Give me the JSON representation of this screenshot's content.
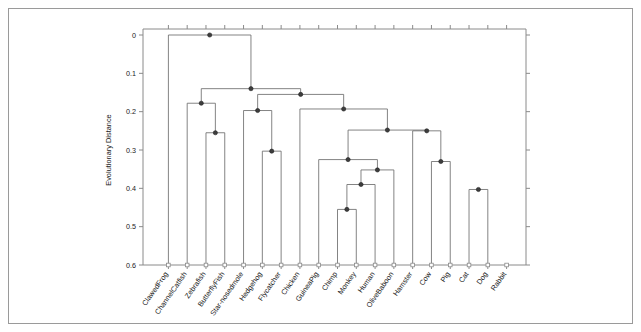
{
  "figure": {
    "background_color": "#ffffff",
    "frame_color": "#9a9a9a",
    "link_color": "#6e6e6e",
    "node_color": "#3d3d3d"
  },
  "chart_data": {
    "type": "dendrogram",
    "title": "",
    "xlabel": "",
    "ylabel": "Evolutionary Distance",
    "ylim": [
      0.0,
      0.6
    ],
    "y_inverted": true,
    "grid": false,
    "legend": "none",
    "y_ticks": [
      "0",
      "0.1",
      "0.2",
      "0.3",
      "0.4",
      "0.5",
      "0.6"
    ],
    "y_tick_values": [
      0.0,
      0.1,
      0.2,
      0.3,
      0.4,
      0.5,
      0.6
    ],
    "leaf_count": 18,
    "leaves": [
      "ClawedFrog",
      "ChannelCatfish",
      "Zebrafish",
      "ButterflyFish",
      "Star-nosedmole",
      "Hedgehog",
      "Flycatcher",
      "Chicken",
      "GuineaPig",
      "Chimp",
      "Monkey",
      "Human",
      "OliveBaboon",
      "Hamster",
      "Cow",
      "Pig",
      "Cat",
      "Dog",
      "Rabbit"
    ],
    "merges": [
      {
        "id": "m1",
        "height": 0.455,
        "left": "Chimp",
        "right": "Monkey"
      },
      {
        "id": "m2",
        "height": 0.39,
        "left": "m1",
        "right": "Human"
      },
      {
        "id": "m3",
        "height": 0.352,
        "left": "m2",
        "right": "OliveBaboon"
      },
      {
        "id": "m4",
        "height": 0.325,
        "left": "m3",
        "right": "GuineaPig"
      },
      {
        "id": "m5",
        "height": 0.403,
        "left": "Cat",
        "right": "Dog"
      },
      {
        "id": "m6",
        "height": 0.33,
        "left": "Cow",
        "right": "Pig"
      },
      {
        "id": "m7",
        "height": 0.25,
        "left": "Hamster",
        "right": "m6"
      },
      {
        "id": "m8",
        "height": 0.248,
        "left": "m4",
        "right": "m7"
      },
      {
        "id": "m9",
        "height": 0.193,
        "left": "Chicken",
        "right": "m8"
      },
      {
        "id": "m10",
        "height": 0.303,
        "left": "Hedgehog",
        "right": "Flycatcher"
      },
      {
        "id": "m11",
        "height": 0.197,
        "left": "Star-nosedmole",
        "right": "m10"
      },
      {
        "id": "m12",
        "height": 0.255,
        "left": "Zebrafish",
        "right": "ButterflyFish"
      },
      {
        "id": "m13",
        "height": 0.178,
        "left": "ChannelCatfish",
        "right": "m12"
      },
      {
        "id": "m14",
        "height": 0.155,
        "left": "m11",
        "right": "m9"
      },
      {
        "id": "m15",
        "height": 0.14,
        "left": "m13",
        "right": "m14"
      },
      {
        "id": "m16",
        "height": 0.0,
        "left": "ClawedFrog",
        "right": "m15"
      }
    ],
    "node_heights": [
      0.0,
      0.14,
      0.155,
      0.178,
      0.193,
      0.197,
      0.248,
      0.25,
      0.255,
      0.303,
      0.325,
      0.33,
      0.352,
      0.39,
      0.403,
      0.455
    ]
  }
}
